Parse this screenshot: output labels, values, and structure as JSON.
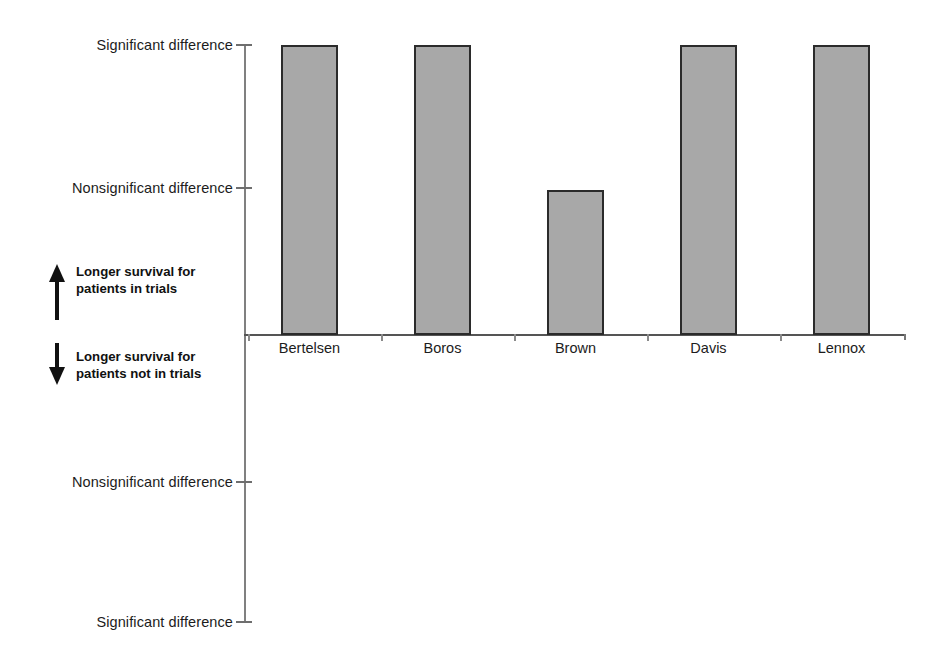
{
  "chart_data": {
    "type": "bar",
    "title": "",
    "subtitle": "",
    "xlabel": "",
    "ylabel": "",
    "grid": false,
    "legend": "none",
    "categories": [
      "Bertelsen",
      "Boros",
      "Brown",
      "Davis",
      "Lennox"
    ],
    "values": [
      2,
      2,
      1,
      2,
      2
    ],
    "value_labels": [
      "Significant difference",
      "Significant difference",
      "Nonsignificant difference",
      "Significant difference",
      "Significant difference"
    ],
    "series": [
      {
        "name": "Survival difference",
        "values": [
          2,
          2,
          1,
          2,
          2
        ]
      }
    ],
    "ylim": [
      -2,
      2
    ],
    "y_ticks": [
      {
        "value": 2,
        "label": "Significant difference"
      },
      {
        "value": 1,
        "label": "Nonsignificant difference"
      },
      {
        "value": -1,
        "label": "Nonsignificant difference"
      },
      {
        "value": -2,
        "label": "Significant difference"
      }
    ],
    "annotations": [
      {
        "name": "up-direction",
        "icon": "arrow-up-icon",
        "line1": "Longer survival for",
        "line2": "patients in trials"
      },
      {
        "name": "down-direction",
        "icon": "arrow-down-icon",
        "line1": "Longer survival for",
        "line2": "patients not in trials"
      }
    ],
    "colors": {
      "bar_fill": "#a8a8a8",
      "bar_border": "#2b2b2b",
      "axis": "#6e6e6e",
      "text": "#1c1c1c"
    }
  },
  "y_axis": {
    "ticks": [
      {
        "label": "Significant difference",
        "top": 45
      },
      {
        "label": "Nonsignificant difference",
        "top": 188
      },
      {
        "label": "Nonsignificant difference",
        "top": 482
      },
      {
        "label": "Significant difference",
        "top": 622
      }
    ]
  },
  "bars": [
    {
      "label": "Bertelsen",
      "left": 281,
      "width": 57,
      "top": 45,
      "height": 290
    },
    {
      "label": "Boros",
      "left": 414,
      "width": 57,
      "top": 45,
      "height": 290
    },
    {
      "label": "Brown",
      "left": 547,
      "width": 57,
      "top": 190,
      "height": 145
    },
    {
      "label": "Davis",
      "left": 680,
      "width": 57,
      "top": 45,
      "height": 290
    },
    {
      "label": "Lennox",
      "left": 813,
      "width": 57,
      "top": 45,
      "height": 290
    }
  ],
  "x_ticks": [
    248,
    381,
    514,
    647,
    780,
    904
  ],
  "notes": {
    "up": {
      "line1": "Longer survival for",
      "line2": "patients in trials"
    },
    "down": {
      "line1": "Longer survival for",
      "line2": "patients not in trials"
    }
  }
}
